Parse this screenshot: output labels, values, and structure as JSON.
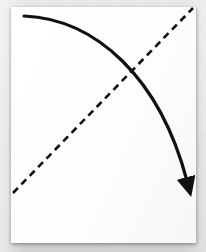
{
  "scene": {
    "title": "Hand-drawn diagram of a descending curve crossing an ascending dashed diagonal",
    "background_color": "#dedede",
    "paper_color": "#fefefe",
    "ink_color": "#111111"
  },
  "paper": {
    "name": "white-paper-sheet",
    "x": 11,
    "y": 7,
    "width": 185,
    "height": 236
  },
  "figure": {
    "curve": {
      "label": "solid-arrow-curve",
      "style": "solid",
      "color": "#111111",
      "stroke_width": 3.2,
      "start": [
        24,
        16
      ],
      "control_1": [
        96,
        19
      ],
      "control_2": [
        160,
        78
      ],
      "end": [
        187,
        181
      ],
      "has_arrowhead": true,
      "arrowhead_end": "end",
      "direction": "descending left-to-right"
    },
    "arrowhead": {
      "label": "arrowhead-triangle",
      "tip": [
        191,
        189
      ],
      "angle_degrees": 72,
      "length": 17,
      "half_width": 5,
      "color": "#111111"
    },
    "dashed_line": {
      "label": "dashed-diagonal-line",
      "style": "dashed",
      "color": "#111111",
      "stroke_width": 2.6,
      "dash_length": 7,
      "dash_gap": 5,
      "start": [
        13,
        193
      ],
      "end": [
        193,
        8
      ],
      "direction": "ascending left-to-right"
    },
    "intersection": {
      "label": "curve-dashed-crossing-point",
      "point": [
        133,
        72
      ]
    }
  }
}
